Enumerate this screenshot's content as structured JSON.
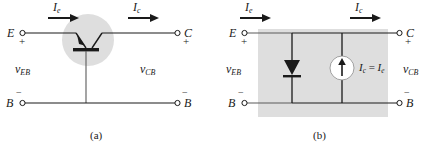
{
  "figure": {
    "type": "circuit-diagram",
    "background": "#ffffff",
    "line_color": "#1a1a1a",
    "shade_color": "#d9d9d9",
    "panels": [
      {
        "id": "a",
        "caption": "(a)",
        "description": "PNP bipolar junction transistor in common-base configuration",
        "device": "pnp-transistor",
        "terminals": [
          {
            "name": "E",
            "label": "E",
            "polarity": "+",
            "side": "left-top"
          },
          {
            "name": "C",
            "label": "C",
            "polarity": "+",
            "side": "right-top"
          },
          {
            "name": "B-left",
            "label": "B",
            "polarity": "−",
            "side": "left-bottom"
          },
          {
            "name": "B-right",
            "label": "B",
            "polarity": "−",
            "side": "right-bottom"
          }
        ],
        "currents": [
          {
            "symbol": "I",
            "subscript": "e",
            "label": "I_e",
            "direction": "right",
            "position": "emitter-branch"
          },
          {
            "symbol": "I",
            "subscript": "c",
            "label": "I_c",
            "direction": "right",
            "position": "collector-branch"
          }
        ],
        "voltages": [
          {
            "symbol": "v",
            "subscript": "EB",
            "label": "v_EB",
            "position": "left"
          },
          {
            "symbol": "v",
            "subscript": "CB",
            "label": "v_CB",
            "position": "right"
          }
        ]
      },
      {
        "id": "b",
        "caption": "(b)",
        "description": "Equivalent large-signal model: emitter-base diode and collector current source",
        "shaded_region": true,
        "terminals": [
          {
            "name": "E",
            "label": "E",
            "polarity": "+",
            "side": "left-top"
          },
          {
            "name": "C",
            "label": "C",
            "polarity": "+",
            "side": "right-top"
          },
          {
            "name": "B-left",
            "label": "B",
            "polarity": "−",
            "side": "left-bottom"
          },
          {
            "name": "B-right",
            "label": "B",
            "polarity": "−",
            "side": "right-bottom"
          }
        ],
        "currents": [
          {
            "symbol": "I",
            "subscript": "e",
            "label": "I_e",
            "direction": "right",
            "position": "emitter-branch"
          },
          {
            "symbol": "I",
            "subscript": "c",
            "label": "I_c",
            "direction": "right",
            "position": "collector-branch"
          }
        ],
        "voltages": [
          {
            "symbol": "v",
            "subscript": "EB",
            "label": "v_EB",
            "position": "left"
          },
          {
            "symbol": "v",
            "subscript": "CB",
            "label": "v_CB",
            "position": "right"
          }
        ],
        "components": [
          {
            "type": "diode",
            "orientation": "pointing-down",
            "name": "emitter-base-diode"
          },
          {
            "type": "current-source",
            "orientation": "arrow-up",
            "name": "collector-current-source",
            "equation": {
              "lhs_symbol": "I",
              "lhs_sub": "c",
              "eq": "=",
              "rhs_symbol": "I",
              "rhs_sub": "e",
              "text": "I_c = I_e"
            }
          }
        ]
      }
    ]
  },
  "labels": {
    "E": "E",
    "C": "C",
    "B": "B",
    "plus": "+",
    "minus": "−",
    "I": "I",
    "sub_e": "e",
    "sub_c": "c",
    "v": "v",
    "sub_EB": "EB",
    "sub_CB": "CB",
    "eq": "=",
    "caption_a": "(a)",
    "caption_b": "(b)"
  }
}
